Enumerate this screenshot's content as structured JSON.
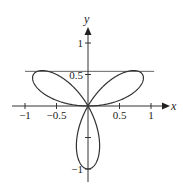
{
  "figure": {
    "type": "polar-rose-plot",
    "equation": "r = sin(3θ)",
    "axes": {
      "x_label": "x",
      "y_label": "y",
      "x_ticks": [
        {
          "value": -1,
          "label": "−1"
        },
        {
          "value": -0.5,
          "label": "−0.5"
        },
        {
          "value": 0.5,
          "label": "0.5"
        },
        {
          "value": 1,
          "label": "1"
        }
      ],
      "y_ticks": [
        {
          "value": 1,
          "label": "1"
        },
        {
          "value": 0.5,
          "label": "0.5"
        },
        {
          "value": -0.5,
          "label": ""
        },
        {
          "value": -1,
          "label": "−1"
        }
      ]
    },
    "horizontal_line": {
      "y": 0.55,
      "x_from": -1.0,
      "x_to": 1.05
    },
    "colors": {
      "curve": "#333333",
      "axes": "#333333",
      "line": "#555555"
    }
  },
  "chart_data": {
    "type": "line",
    "title": "",
    "xlabel": "x",
    "ylabel": "y",
    "xlim": [
      -1.1,
      1.1
    ],
    "ylim": [
      -1.2,
      1.3
    ],
    "grid": false,
    "series": [
      {
        "name": "r = sin(3θ) three-petal rose",
        "petals": [
          {
            "tip": [
              0.866,
              0.5
            ]
          },
          {
            "tip": [
              -0.866,
              0.5
            ]
          },
          {
            "tip": [
              0,
              -1
            ]
          }
        ]
      },
      {
        "name": "horizontal tangent line",
        "y": 0.55
      }
    ]
  }
}
